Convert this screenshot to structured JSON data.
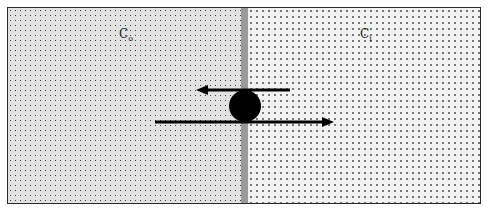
{
  "diagram": {
    "regions": [
      {
        "id": "outside",
        "label": "C",
        "subscript": "o",
        "fill": "#e2e2e2"
      },
      {
        "id": "inside",
        "label": "C",
        "subscript": "i",
        "fill": "#f3f3f3"
      }
    ],
    "membrane": {
      "color": "#9a9a9a"
    },
    "particle": {
      "shape": "circle",
      "color": "#000000"
    },
    "arrows": [
      {
        "id": "top-arrow",
        "direction": "left",
        "color": "#000000"
      },
      {
        "id": "bottom-arrow",
        "direction": "right",
        "color": "#000000"
      }
    ]
  }
}
